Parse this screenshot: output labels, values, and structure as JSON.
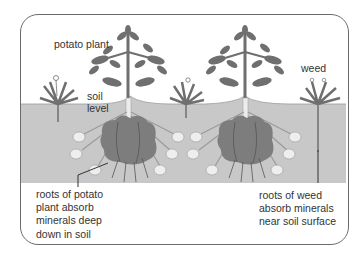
{
  "diagram": {
    "labels": {
      "potato_plant": "potato plant",
      "weed": "weed",
      "soil_level": [
        "soil",
        "level"
      ],
      "roots_potato": [
        "roots of potato",
        "plant absorb",
        "minerals deep",
        "down in soil"
      ],
      "roots_weed": [
        "roots of weed",
        "absorb minerals",
        "near soil surface"
      ]
    },
    "colors": {
      "soil": "#c8c8c8",
      "frame_border": "#6b6b6b",
      "foliage": "#6f6f6f",
      "tuber": "#7d7d7d",
      "tuber_small": "#e6e6e6",
      "text": "#333333"
    }
  }
}
